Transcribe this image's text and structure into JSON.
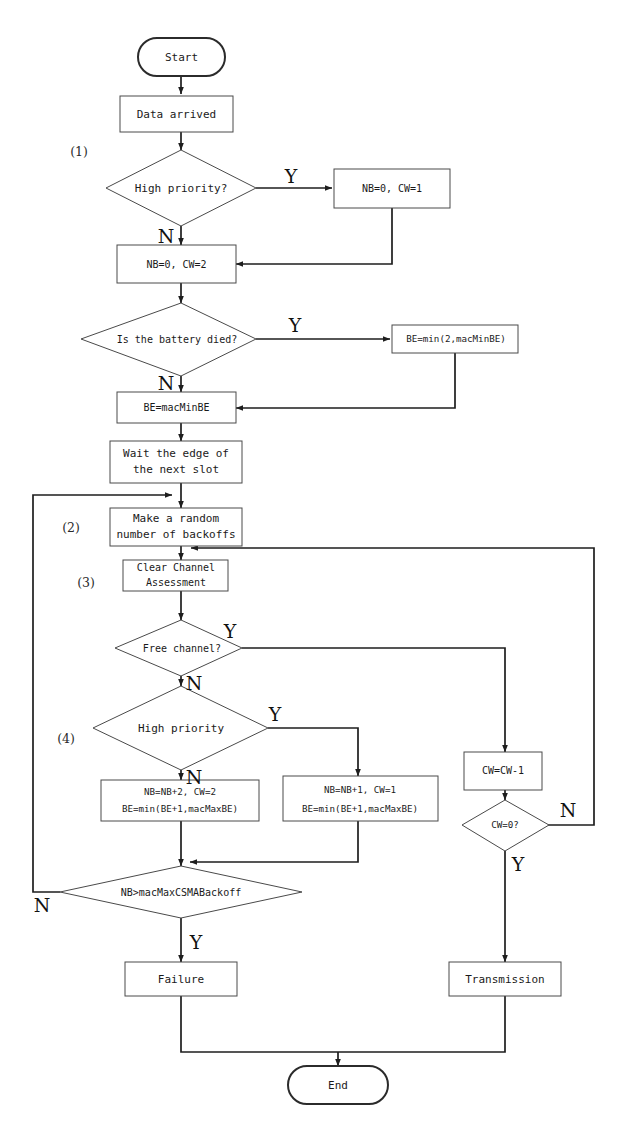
{
  "diagram": {
    "type": "flowchart",
    "background_color": "#ffffff",
    "line_color": "#1e1e1e",
    "shape_stroke_color": "#4a4a4a",
    "text_color": "#1a1a1a"
  },
  "nodes": {
    "start": {
      "label": "Start",
      "shape": "terminator"
    },
    "data_arrived": {
      "label": "Data arrived",
      "shape": "process"
    },
    "high_priority_1": {
      "label": "High priority?",
      "shape": "decision"
    },
    "nb0_cw1": {
      "label": "NB=0, CW=1",
      "shape": "process"
    },
    "nb0_cw2": {
      "label": "NB=0, CW=2",
      "shape": "process"
    },
    "battery_died": {
      "label": "Is the battery died?",
      "shape": "decision"
    },
    "be_min2": {
      "label": "BE=min(2,macMinBE)",
      "shape": "process"
    },
    "be_macminbe": {
      "label": "BE=macMinBE",
      "shape": "process"
    },
    "wait_slot": {
      "line1": "Wait the edge of",
      "line2": "the next slot",
      "shape": "process"
    },
    "random_backoff": {
      "line1": "Make a random",
      "line2": "number of backoffs",
      "shape": "process"
    },
    "cca": {
      "line1": "Clear Channel",
      "line2": "Assessment",
      "shape": "process"
    },
    "free_channel": {
      "label": "Free channel?",
      "shape": "decision"
    },
    "high_priority_2": {
      "label": "High priority",
      "shape": "decision"
    },
    "nb_plus2": {
      "line1": "NB=NB+2, CW=2",
      "line2": "BE=min(BE+1,macMaxBE)",
      "shape": "process"
    },
    "nb_plus1": {
      "line1": "NB=NB+1, CW=1",
      "line2": "BE=min(BE+1,macMaxBE)",
      "shape": "process"
    },
    "cw_dec": {
      "label": "CW=CW-1",
      "shape": "process"
    },
    "cw_zero": {
      "label": "CW=0?",
      "shape": "decision"
    },
    "nb_gt_max": {
      "label": "NB>macMaxCSMABackoff",
      "shape": "decision"
    },
    "failure": {
      "label": "Failure",
      "shape": "process"
    },
    "transmission": {
      "label": "Transmission",
      "shape": "process"
    },
    "end": {
      "label": "End",
      "shape": "terminator"
    }
  },
  "branch_labels": {
    "hp1_yes": "Y",
    "hp1_no": "N",
    "battery_yes": "Y",
    "battery_no": "N",
    "free_yes": "Y",
    "free_no": "N",
    "hp2_yes": "Y",
    "hp2_no": "N",
    "cw_zero_no": "N",
    "cw_zero_yes": "Y",
    "nbmax_no": "N",
    "nbmax_yes": "Y"
  },
  "step_labels": {
    "s1": "(1)",
    "s2": "(2)",
    "s3": "(3)",
    "s4": "(4)"
  },
  "caption": {
    "text": ""
  }
}
